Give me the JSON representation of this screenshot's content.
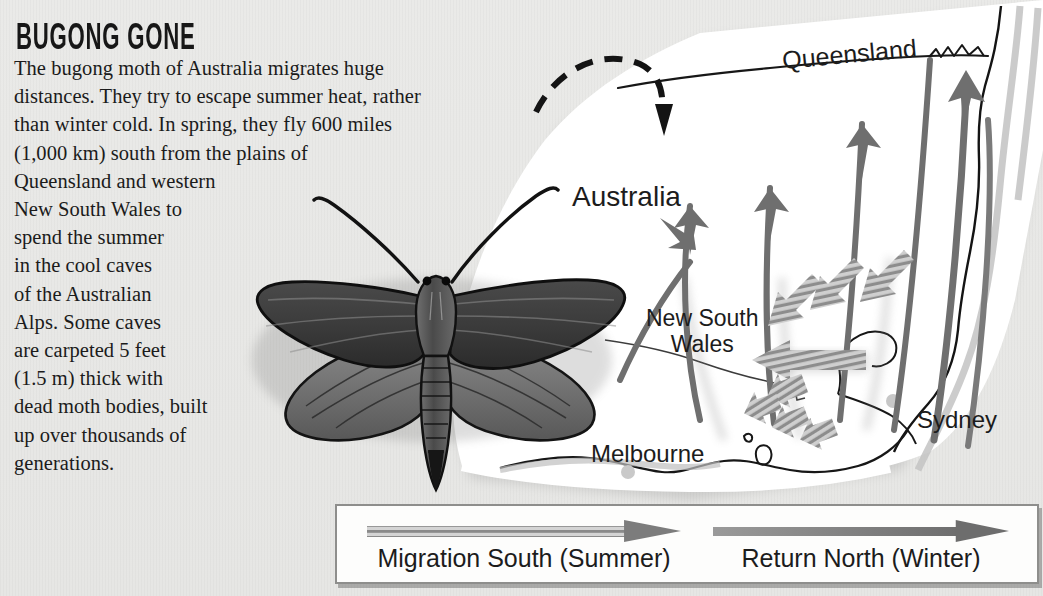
{
  "title": "BUGONG GONE",
  "body_lines": [
    "The bugong moth of Australia migrates huge",
    "distances. They try to escape summer heat, rather",
    "than winter cold. In spring, they fly 600 miles",
    "(1,000 km) south from the plains of",
    "Queensland and western",
    "New South Wales to",
    "spend the summer",
    "in the cool caves",
    "of the Australian",
    "Alps. Some caves",
    "are carpeted 5 feet",
    "(1.5 m) thick with",
    "dead moth bodies, built",
    "up over thousands of",
    "generations."
  ],
  "map": {
    "labels": {
      "queensland": "Queensland",
      "australia": "Australia",
      "new_south_wales_line1": "New South",
      "new_south_wales_line2": "Wales",
      "melbourne": "Melbourne",
      "sydney": "Sydney"
    }
  },
  "legend": {
    "south_label": "Migration South (Summer)",
    "north_label": "Return North (Winter)"
  },
  "colors": {
    "page_background": "#e9e9e7",
    "landmass": "#ffffff",
    "arrow_gray": "#6f6f6f",
    "arrow_light_gray": "#9a9a9a",
    "ink_black": "#1b1b1b",
    "legend_border": "#8e8e8c",
    "moth_dark": "#3c3c3c",
    "moth_mid": "#6a6a6a"
  }
}
